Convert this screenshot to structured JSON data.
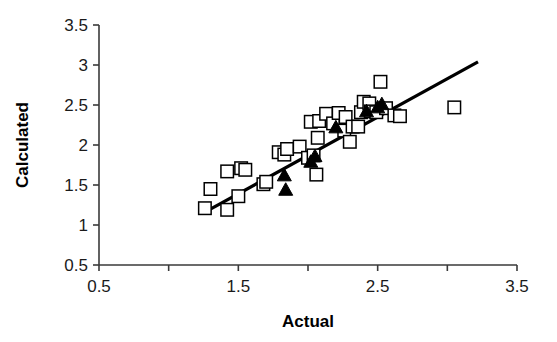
{
  "chart_data": {
    "type": "scatter",
    "title": "",
    "xlabel": "Actual",
    "ylabel": "Calculated",
    "xlim": [
      0.5,
      3.5
    ],
    "ylim": [
      0.5,
      3.5
    ],
    "xticks": [
      0.5,
      1.0,
      1.5,
      2.0,
      2.5,
      3.0,
      3.5
    ],
    "xtick_labels": [
      "0.5",
      "",
      "1.5",
      "",
      "2.5",
      "",
      "3.5"
    ],
    "yticks": [
      0.5,
      1.0,
      1.5,
      2.0,
      2.5,
      3.0,
      3.5
    ],
    "ytick_labels": [
      "0.5",
      "1",
      "1.5",
      "2",
      "2.5",
      "3",
      "3.5"
    ],
    "grid": false,
    "legend": "none",
    "series": [
      {
        "name": "open-squares",
        "marker": "square-open",
        "color": "#000000",
        "points": [
          [
            1.26,
            1.21
          ],
          [
            1.42,
            1.19
          ],
          [
            1.3,
            1.45
          ],
          [
            1.42,
            1.67
          ],
          [
            1.5,
            1.36
          ],
          [
            1.52,
            1.71
          ],
          [
            1.55,
            1.69
          ],
          [
            1.68,
            1.51
          ],
          [
            1.7,
            1.54
          ],
          [
            1.79,
            1.91
          ],
          [
            1.83,
            1.88
          ],
          [
            1.85,
            1.95
          ],
          [
            1.94,
            1.98
          ],
          [
            2.0,
            1.84
          ],
          [
            2.04,
            1.87
          ],
          [
            2.06,
            1.63
          ],
          [
            2.07,
            2.09
          ],
          [
            2.02,
            2.29
          ],
          [
            2.08,
            2.3
          ],
          [
            2.13,
            2.39
          ],
          [
            2.18,
            2.27
          ],
          [
            2.22,
            2.4
          ],
          [
            2.26,
            2.18
          ],
          [
            2.27,
            2.35
          ],
          [
            2.3,
            2.04
          ],
          [
            2.32,
            2.23
          ],
          [
            2.36,
            2.23
          ],
          [
            2.38,
            2.41
          ],
          [
            2.4,
            2.54
          ],
          [
            2.44,
            2.52
          ],
          [
            2.45,
            2.42
          ],
          [
            2.49,
            2.41
          ],
          [
            2.52,
            2.79
          ],
          [
            2.56,
            2.46
          ],
          [
            2.62,
            2.37
          ],
          [
            2.66,
            2.36
          ],
          [
            3.05,
            2.47
          ]
        ]
      },
      {
        "name": "filled-triangles",
        "marker": "triangle-filled",
        "color": "#000000",
        "points": [
          [
            1.83,
            1.63
          ],
          [
            1.84,
            1.45
          ],
          [
            2.02,
            1.8
          ],
          [
            2.05,
            1.87
          ],
          [
            2.2,
            2.23
          ],
          [
            2.42,
            2.43
          ],
          [
            2.5,
            2.48
          ],
          [
            2.53,
            2.52
          ]
        ]
      }
    ],
    "trendline": {
      "name": "regression-line",
      "color": "#000000",
      "x0": 1.26,
      "y0": 1.16,
      "x1": 3.22,
      "y1": 3.04
    }
  }
}
